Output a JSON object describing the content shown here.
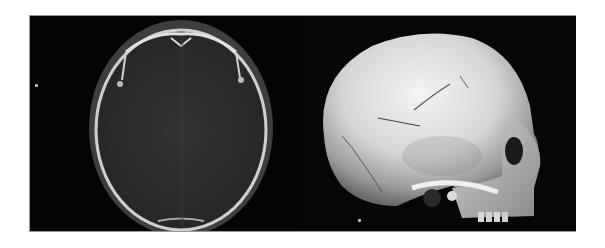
{
  "figure": {
    "panels": [
      {
        "id": "left",
        "content": "axial CT slice of skull (bone window)",
        "marker": "small dot"
      },
      {
        "id": "right",
        "content": "3D volume rendering of skull, lateral view",
        "marker": "small dot"
      }
    ],
    "colors": {
      "background": "#050505",
      "bone_bright": "#e8e8e8",
      "soft_tissue": "#4a4a4a",
      "brain": "#2b2b2b"
    }
  }
}
